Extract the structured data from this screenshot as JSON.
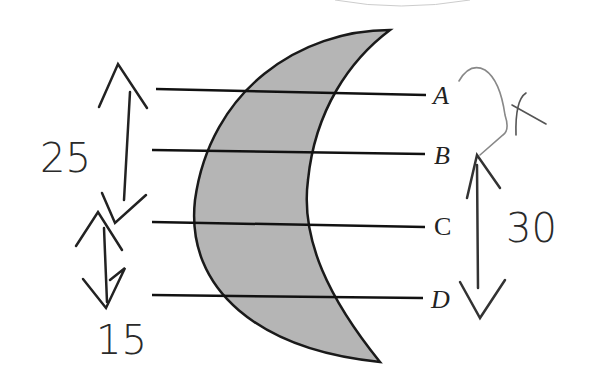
{
  "diagram": {
    "type": "crescent lens cross-section with parallel lines",
    "lines": [
      {
        "label": "A",
        "y": 93
      },
      {
        "label": "B",
        "y": 153
      },
      {
        "label": "C",
        "y": 225
      },
      {
        "label": "D",
        "y": 298
      }
    ],
    "annotations": {
      "left_top_measure": "25",
      "left_bottom_measure": "15",
      "right_measure": "30",
      "right_mark": "x"
    },
    "colors": {
      "fill": "#b5b5b5",
      "stroke": "#1a1a1a"
    }
  }
}
